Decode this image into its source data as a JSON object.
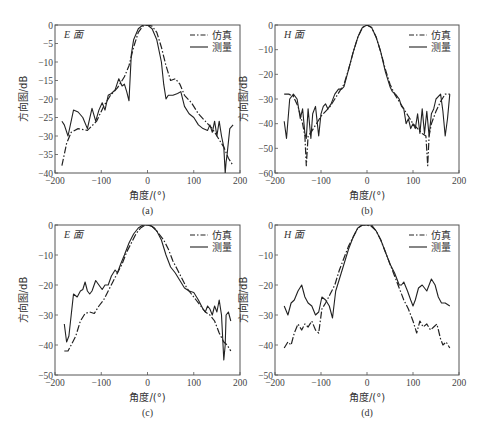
{
  "chart_data": [
    {
      "id": "a",
      "type": "line",
      "caption": "(a)",
      "plane_label": "E 面",
      "xlabel": "角度/(°)",
      "ylabel": "方向图/dB",
      "xlim": [
        -200,
        200
      ],
      "ylim": [
        -40,
        0
      ],
      "xticks": [
        -200,
        -100,
        0,
        100,
        200
      ],
      "yticks": [
        0,
        -5,
        -10,
        -15,
        -20,
        -25,
        -30,
        -35,
        -40
      ],
      "grid": false,
      "legend": {
        "position": "upper right",
        "entries": [
          "仿真",
          "测量"
        ]
      },
      "series": [
        {
          "name": "仿真",
          "style": "dashdot",
          "x": [
            -185,
            -175,
            -165,
            -150,
            -130,
            -110,
            -95,
            -80,
            -65,
            -50,
            -40,
            -30,
            -20,
            -10,
            0,
            10,
            20,
            30,
            40,
            50,
            60,
            70,
            80,
            95,
            110,
            125,
            140,
            155,
            165,
            175,
            185
          ],
          "y": [
            -38,
            -32,
            -29,
            -28,
            -28.5,
            -26,
            -22,
            -19,
            -17,
            -14,
            -11,
            -6,
            -2,
            -0.3,
            0,
            -0.3,
            -2,
            -6,
            -11,
            -15,
            -14.5,
            -16,
            -19,
            -21,
            -24,
            -26,
            -28,
            -31,
            -33,
            -36,
            -38
          ]
        },
        {
          "name": "测量",
          "style": "solid",
          "x": [
            -185,
            -180,
            -172,
            -160,
            -150,
            -140,
            -130,
            -120,
            -112,
            -105,
            -98,
            -92,
            -85,
            -78,
            -70,
            -62,
            -55,
            -50,
            -45,
            -40,
            -35,
            -30,
            -20,
            -10,
            0,
            10,
            20,
            30,
            35,
            40,
            45,
            55,
            65,
            72,
            80,
            90,
            100,
            110,
            120,
            130,
            135,
            140,
            145,
            150,
            155,
            160,
            165,
            168,
            170,
            172,
            178,
            185
          ],
          "y": [
            -26,
            -27,
            -30,
            -23,
            -23.5,
            -25,
            -28,
            -22.5,
            -26,
            -23,
            -21,
            -23,
            -19,
            -18.5,
            -17.5,
            -14.5,
            -16.5,
            -16,
            -18,
            -20.5,
            -8,
            -4,
            -1,
            0,
            0,
            -1,
            -4,
            -10,
            -16,
            -20,
            -19,
            -19,
            -18.5,
            -18,
            -22,
            -24,
            -25,
            -27,
            -28,
            -28.5,
            -27,
            -29,
            -26,
            -30,
            -26,
            -30,
            -33,
            -40,
            -37,
            -35,
            -28,
            -27
          ]
        }
      ]
    },
    {
      "id": "b",
      "type": "line",
      "caption": "(b)",
      "plane_label": "H 面",
      "xlabel": "角度/(°)",
      "ylabel": "方向图/dB",
      "xlim": [
        -200,
        200
      ],
      "ylim": [
        -60,
        0
      ],
      "xticks": [
        -200,
        -100,
        0,
        100,
        200
      ],
      "yticks": [
        0,
        -10,
        -20,
        -30,
        -40,
        -50,
        -60
      ],
      "grid": false,
      "legend": {
        "position": "upper right",
        "entries": [
          "仿真",
          "测量"
        ]
      },
      "series": [
        {
          "name": "仿真",
          "style": "dashdot",
          "x": [
            -180,
            -170,
            -160,
            -150,
            -140,
            -135,
            -132,
            -128,
            -120,
            -110,
            -100,
            -90,
            -80,
            -70,
            -60,
            -50,
            -40,
            -30,
            -20,
            -10,
            0,
            10,
            20,
            30,
            40,
            50,
            60,
            70,
            80,
            90,
            100,
            110,
            120,
            128,
            132,
            135,
            140,
            150,
            160,
            170,
            180
          ],
          "y": [
            -28,
            -28,
            -29,
            -33,
            -40,
            -45,
            -57,
            -45,
            -43,
            -40,
            -37,
            -35,
            -33,
            -30,
            -27,
            -24,
            -18,
            -11,
            -5,
            -1,
            0,
            -1,
            -5,
            -11,
            -18,
            -24,
            -28,
            -31,
            -34,
            -37,
            -40,
            -42,
            -44,
            -45,
            -57,
            -45,
            -40,
            -35,
            -31,
            -28,
            -28
          ]
        },
        {
          "name": "测量",
          "style": "solid",
          "x": [
            -180,
            -175,
            -168,
            -160,
            -152,
            -145,
            -140,
            -135,
            -132,
            -128,
            -122,
            -118,
            -112,
            -105,
            -100,
            -95,
            -90,
            -85,
            -78,
            -70,
            -62,
            -55,
            -50,
            -40,
            -30,
            -20,
            -10,
            0,
            10,
            20,
            30,
            40,
            50,
            55,
            62,
            70,
            75,
            80,
            85,
            90,
            95,
            100,
            105,
            110,
            115,
            120,
            125,
            130,
            135,
            140,
            145,
            150,
            160,
            165,
            170,
            175,
            180
          ],
          "y": [
            -39,
            -46,
            -30,
            -28,
            -30,
            -38,
            -34,
            -44,
            -46,
            -34,
            -46,
            -36,
            -33,
            -45,
            -36,
            -33,
            -32,
            -34,
            -32,
            -28,
            -26,
            -26,
            -25,
            -18,
            -11,
            -5,
            -1,
            0,
            -1,
            -5,
            -11,
            -19,
            -25,
            -27,
            -28,
            -30,
            -33,
            -34,
            -40,
            -38,
            -42,
            -40,
            -42,
            -36,
            -44,
            -34,
            -44,
            -35,
            -45,
            -36,
            -34,
            -30,
            -28,
            -35,
            -45,
            -38,
            -28
          ]
        }
      ]
    },
    {
      "id": "c",
      "type": "line",
      "caption": "(c)",
      "plane_label": "E 面",
      "xlabel": "角度/(°)",
      "ylabel": "方向图/dB",
      "xlim": [
        -200,
        200
      ],
      "ylim": [
        -50,
        0
      ],
      "xticks": [
        -200,
        -100,
        0,
        100,
        200
      ],
      "yticks": [
        0,
        -10,
        -20,
        -30,
        -40,
        -50
      ],
      "grid": false,
      "legend": {
        "position": "upper right",
        "entries": [
          "仿真",
          "测量"
        ]
      },
      "series": [
        {
          "name": "仿真",
          "style": "dashdot",
          "x": [
            -180,
            -172,
            -165,
            -155,
            -145,
            -135,
            -125,
            -115,
            -105,
            -95,
            -85,
            -75,
            -65,
            -55,
            -45,
            -35,
            -25,
            -15,
            -5,
            0,
            5,
            15,
            25,
            35,
            45,
            55,
            65,
            75,
            85,
            95,
            105,
            115,
            125,
            135,
            145,
            155,
            165,
            172,
            180
          ],
          "y": [
            -42,
            -42,
            -40,
            -37,
            -32,
            -29.5,
            -29,
            -29.5,
            -27,
            -25,
            -22,
            -19,
            -16,
            -13,
            -9,
            -6,
            -3,
            -1,
            0,
            0,
            0,
            -1,
            -3,
            -5,
            -8,
            -12,
            -15,
            -18,
            -21,
            -23,
            -25,
            -27,
            -29,
            -30,
            -32,
            -36,
            -39,
            -40,
            -42
          ]
        },
        {
          "name": "测量",
          "style": "solid",
          "x": [
            -180,
            -175,
            -170,
            -165,
            -160,
            -152,
            -145,
            -140,
            -135,
            -130,
            -125,
            -120,
            -112,
            -105,
            -98,
            -92,
            -85,
            -78,
            -70,
            -65,
            -58,
            -50,
            -40,
            -30,
            -20,
            -10,
            0,
            10,
            20,
            30,
            40,
            50,
            60,
            70,
            80,
            90,
            100,
            110,
            120,
            125,
            130,
            135,
            140,
            145,
            150,
            155,
            160,
            165,
            168,
            170,
            175,
            180
          ],
          "y": [
            -33,
            -39,
            -37,
            -30,
            -23,
            -24,
            -22,
            -21.5,
            -19,
            -22,
            -23,
            -22,
            -18.5,
            -20,
            -21.5,
            -20,
            -20,
            -17,
            -15,
            -16,
            -13,
            -10,
            -6,
            -3,
            -1,
            0,
            0,
            -0.5,
            -2,
            -5,
            -10,
            -14,
            -16,
            -18.5,
            -21,
            -22,
            -22.5,
            -25,
            -28,
            -29,
            -27,
            -28,
            -30,
            -27,
            -29,
            -25,
            -30,
            -45,
            -40,
            -30,
            -29,
            -32
          ]
        }
      ]
    },
    {
      "id": "d",
      "type": "line",
      "caption": "(d)",
      "plane_label": "H 面",
      "xlabel": "角度/(°)",
      "ylabel": "方向图/dB",
      "xlim": [
        -200,
        200
      ],
      "ylim": [
        -50,
        0
      ],
      "xticks": [
        -200,
        -100,
        0,
        100,
        200
      ],
      "yticks": [
        0,
        -10,
        -20,
        -30,
        -40,
        -50
      ],
      "grid": false,
      "legend": {
        "position": "upper right",
        "entries": [
          "仿真",
          "测量"
        ]
      },
      "series": [
        {
          "name": "仿真",
          "style": "dashdot",
          "x": [
            -180,
            -172,
            -165,
            -158,
            -150,
            -142,
            -135,
            -128,
            -120,
            -112,
            -105,
            -98,
            -90,
            -80,
            -70,
            -60,
            -50,
            -40,
            -30,
            -20,
            -10,
            0,
            10,
            20,
            30,
            40,
            50,
            60,
            70,
            80,
            90,
            100,
            108,
            115,
            122,
            130,
            138,
            145,
            152,
            160,
            165,
            172,
            180
          ],
          "y": [
            -41,
            -39,
            -40,
            -36,
            -33,
            -35,
            -33,
            -34,
            -32,
            -35,
            -36,
            -28,
            -26,
            -23,
            -20,
            -15,
            -11,
            -7,
            -4,
            -1,
            0,
            0,
            -0.5,
            -2,
            -5,
            -9,
            -13,
            -17,
            -21,
            -25,
            -28,
            -32,
            -36,
            -32,
            -34,
            -33,
            -35,
            -34,
            -33,
            -38,
            -40,
            -39,
            -41
          ]
        },
        {
          "name": "测量",
          "style": "solid",
          "x": [
            -180,
            -172,
            -165,
            -158,
            -150,
            -142,
            -135,
            -128,
            -120,
            -112,
            -105,
            -98,
            -90,
            -82,
            -75,
            -68,
            -60,
            -50,
            -40,
            -30,
            -20,
            -10,
            0,
            10,
            20,
            30,
            40,
            50,
            60,
            70,
            75,
            80,
            88,
            95,
            100,
            105,
            112,
            120,
            130,
            140,
            148,
            155,
            162,
            170,
            180
          ],
          "y": [
            -27,
            -30,
            -26,
            -25,
            -22,
            -20,
            -24,
            -26,
            -27,
            -30,
            -29,
            -24,
            -25,
            -27,
            -31,
            -22,
            -18,
            -13,
            -8,
            -4,
            -1,
            0,
            0,
            0,
            -2,
            -5,
            -9,
            -13,
            -16,
            -20,
            -20,
            -19,
            -22,
            -25,
            -27,
            -25,
            -21,
            -20,
            -22,
            -18,
            -20,
            -24,
            -26,
            -26,
            -27
          ]
        }
      ]
    }
  ]
}
